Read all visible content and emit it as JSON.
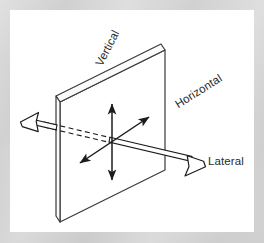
{
  "figure": {
    "panel": {
      "background_color": "#ffffff",
      "mat_color": "#d2d2d2"
    },
    "labels": [
      {
        "id": "vertical",
        "text": "Vertical",
        "rotation_deg": -63,
        "axis": "vertical-axis"
      },
      {
        "id": "horizontal",
        "text": "Horizontal",
        "rotation_deg": -32,
        "axis": "horizontal-axis"
      },
      {
        "id": "lateral",
        "text": "Lateral",
        "rotation_deg": 0,
        "axis": "lateral-axis"
      }
    ],
    "plate": {
      "name": "reference-plane",
      "stroke_color": "#3a3a3a",
      "fill_color": "#ffffff",
      "face_corners": "60,102 165,50 165,170 60,222",
      "edge_thickness_px": 8
    },
    "axes": [
      {
        "id": "vertical-axis",
        "label": "Vertical",
        "style": "thin double-headed arrow",
        "orientation": "up-down, in plane",
        "stroke_color": "#1c1c1c",
        "stroke_width": 1.4
      },
      {
        "id": "horizontal-axis",
        "label": "Horizontal",
        "style": "thin double-headed arrow",
        "orientation": "diagonal up-right / down-left, in plane",
        "stroke_color": "#1c1c1c",
        "stroke_width": 1.4
      },
      {
        "id": "lateral-axis",
        "label": "Lateral",
        "style": "hollow outline double-headed arrow, dashed where occluded",
        "orientation": "through plane, left-right",
        "stroke_color": "#1c1c1c",
        "stroke_width": 1.2
      }
    ]
  }
}
